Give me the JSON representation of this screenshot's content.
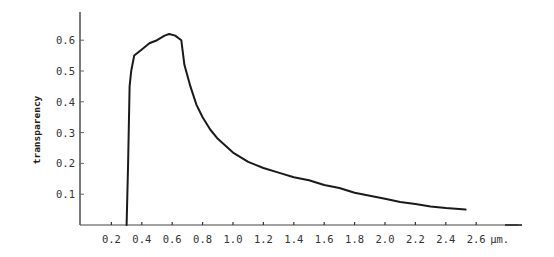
{
  "chart_data": {
    "type": "line",
    "title": "",
    "xlabel": "µm.",
    "ylabel": "transparency",
    "xlim": [
      0.0,
      3.0
    ],
    "ylim": [
      0.0,
      0.68
    ],
    "grid": false,
    "legend": null,
    "x_ticks": [
      0.2,
      0.4,
      0.6,
      0.8,
      1.0,
      1.2,
      1.4,
      1.6,
      1.8,
      2.0,
      2.2,
      2.4,
      2.6
    ],
    "x_tick_labels": [
      "0.2",
      "0.4",
      "0.6",
      "0.8",
      "1.0",
      "1.2",
      "1.4",
      "1.6",
      "1.8",
      "2.0",
      "2.2",
      "2.4",
      "2.6"
    ],
    "y_ticks": [
      0.1,
      0.2,
      0.3,
      0.4,
      0.5,
      0.6
    ],
    "y_tick_labels": [
      "0.1",
      "0.2",
      "0.3",
      "0.4",
      "0.5",
      "0.6"
    ],
    "series": [
      {
        "name": "transparency",
        "color": "#1a1a1a",
        "x": [
          0.3,
          0.31,
          0.32,
          0.33,
          0.35,
          0.4,
          0.45,
          0.5,
          0.55,
          0.58,
          0.62,
          0.66,
          0.68,
          0.72,
          0.76,
          0.8,
          0.85,
          0.9,
          1.0,
          1.1,
          1.2,
          1.3,
          1.4,
          1.5,
          1.6,
          1.7,
          1.8,
          1.9,
          2.0,
          2.1,
          2.2,
          2.3,
          2.4,
          2.53
        ],
        "y": [
          0.0,
          0.2,
          0.45,
          0.5,
          0.55,
          0.57,
          0.59,
          0.6,
          0.615,
          0.62,
          0.615,
          0.6,
          0.52,
          0.45,
          0.39,
          0.35,
          0.31,
          0.28,
          0.235,
          0.205,
          0.185,
          0.17,
          0.155,
          0.145,
          0.13,
          0.12,
          0.105,
          0.095,
          0.085,
          0.075,
          0.068,
          0.06,
          0.055,
          0.05
        ]
      }
    ]
  }
}
